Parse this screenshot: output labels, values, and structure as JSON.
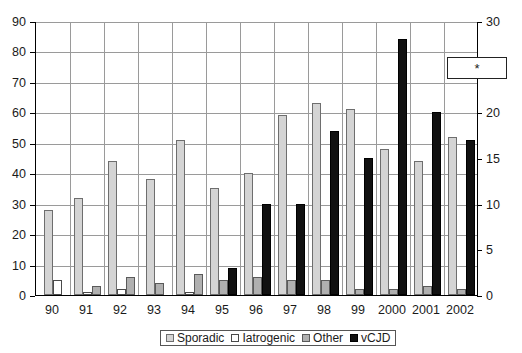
{
  "chart_data": {
    "type": "bar",
    "title": "",
    "subtitle": "",
    "xlabel": "",
    "ylabel": "",
    "y2label": "",
    "grid": true,
    "legend_position": "bottom",
    "categories": [
      "90",
      "91",
      "92",
      "93",
      "94",
      "95",
      "96",
      "97",
      "98",
      "99",
      "2000",
      "2001",
      "2002"
    ],
    "ylim": [
      0,
      90
    ],
    "y_ticks": [
      0,
      10,
      20,
      30,
      40,
      50,
      60,
      70,
      80,
      90
    ],
    "y2lim": [
      0,
      30
    ],
    "y2_ticks": [
      0,
      5,
      10,
      15,
      20,
      25,
      30
    ],
    "series": [
      {
        "name": "Sporadic",
        "axis": "left",
        "color": "#d4d4d4",
        "values": [
          28,
          32,
          44,
          38,
          51,
          35,
          40,
          59,
          63,
          61,
          48,
          44,
          52
        ]
      },
      {
        "name": "Iatrogenic",
        "axis": "left",
        "color": "#ffffff",
        "values": [
          5,
          1,
          2,
          0,
          1,
          0,
          0,
          0,
          0,
          0,
          0,
          0,
          0
        ]
      },
      {
        "name": "Other",
        "axis": "left",
        "color": "#b0b0b0",
        "values": [
          0,
          3,
          6,
          4,
          7,
          5,
          6,
          5,
          5,
          2,
          2,
          3,
          2
        ]
      },
      {
        "name": "vCJD",
        "axis": "right",
        "color": "#111111",
        "values": [
          0,
          0,
          0,
          0,
          0,
          3,
          10,
          10,
          18,
          15,
          28,
          20,
          17
        ]
      }
    ],
    "annotations": [
      {
        "name": "asterisk-marker",
        "text": "*",
        "near_axis": "right",
        "near_value": 25
      }
    ]
  },
  "legend": {
    "items": [
      {
        "label": "Sporadic",
        "swatch": "sporadic"
      },
      {
        "label": "Iatrogenic",
        "swatch": "iatrogenic"
      },
      {
        "label": "Other",
        "swatch": "other"
      },
      {
        "label": "vCJD",
        "swatch": "vcjd"
      }
    ]
  },
  "annotation": {
    "asterisk": "*"
  }
}
